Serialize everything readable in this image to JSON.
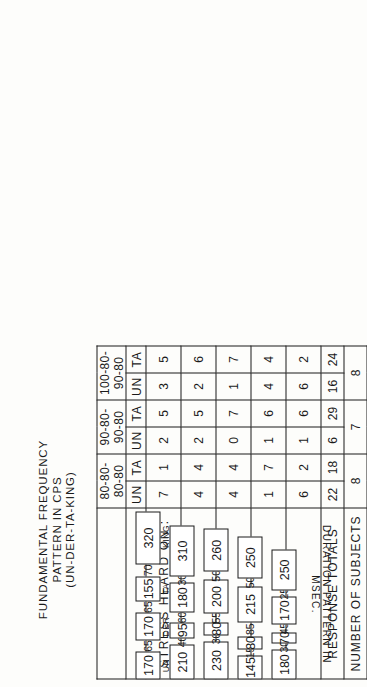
{
  "title": {
    "line1": "FUNDAMENTAL  FREQUENCY",
    "line2": "PATTERN  IN  CPS",
    "line3": "(UN-DER-TA-KING)"
  },
  "table": {
    "group_headers": [
      "80-80-80-80",
      "90-80-90-80",
      "100-80-90-80"
    ],
    "sub_headers": [
      "UN",
      "TA"
    ],
    "stress_label": "STRESS  HEARD  ON :",
    "response_totals_label": "RESPONSE  TOTALS",
    "number_of_subjects_label": "NUMBER  OF  SUBJECTS",
    "rows": [
      {
        "id": "row-1",
        "cells": [
          "7",
          "1",
          "2",
          "5",
          "3",
          "5"
        ]
      },
      {
        "id": "row-2",
        "cells": [
          "4",
          "4",
          "2",
          "5",
          "2",
          "6"
        ]
      },
      {
        "id": "row-3",
        "cells": [
          "4",
          "4",
          "0",
          "7",
          "1",
          "7"
        ]
      },
      {
        "id": "row-4",
        "cells": [
          "1",
          "7",
          "1",
          "6",
          "4",
          "4"
        ]
      },
      {
        "id": "row-5",
        "cells": [
          "6",
          "2",
          "1",
          "6",
          "6",
          "2"
        ]
      }
    ],
    "response_totals": [
      "22",
      "18",
      "6",
      "29",
      "16",
      "24"
    ],
    "number_of_subjects": [
      "8",
      "7",
      "8"
    ]
  },
  "duration": {
    "axis_label": "DURATION  PATTERN  IN  MSEC.",
    "syllables": [
      "UN",
      "DER",
      "TA",
      "KING"
    ],
    "rows": [
      {
        "id": "dur-row-1",
        "segments": [
          "170",
          "65",
          "170",
          "65",
          "155",
          "70",
          "320"
        ],
        "show_syllables": true
      },
      {
        "id": "dur-row-2",
        "segments": [
          "210",
          "40",
          "95",
          "60",
          "180",
          "30",
          "310"
        ],
        "show_syllables": false
      },
      {
        "id": "dur-row-3",
        "segments": [
          "230",
          "30",
          "80",
          "55",
          "200",
          "50",
          "260"
        ],
        "show_syllables": false
      },
      {
        "id": "dur-row-4",
        "segments": [
          "145",
          "15",
          "80",
          "85",
          "215",
          "50",
          "250"
        ],
        "show_syllables": false
      },
      {
        "id": "dur-row-5",
        "segments": [
          "180",
          "30",
          "70",
          "45",
          "170",
          "25",
          "250"
        ],
        "show_syllables": false
      }
    ]
  },
  "colors": {
    "ink": "#1a1a1a",
    "paper": "#fdfdfb"
  }
}
